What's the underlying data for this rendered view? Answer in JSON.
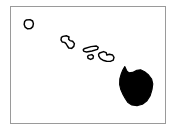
{
  "figure": {
    "subtitle": "Hawaiian Islands",
    "frame_visible": "true",
    "background_color": "#ffffff",
    "frame_color": "#9a9a9a",
    "outline_color": "#000000",
    "fill_color": "#000000",
    "caption": ""
  },
  "map": {
    "name": "hawaii-island-chain-map",
    "region_label": "Hawaii",
    "projection_note": "",
    "island_count": 6,
    "highlighted_island": "Hawaii (Big Island)",
    "islands": [
      {
        "id": "kauai",
        "label": "Kauai",
        "style": "outline",
        "fill": "#ffffff",
        "stroke": "#000000"
      },
      {
        "id": "oahu",
        "label": "Oahu",
        "style": "outline",
        "fill": "#ffffff",
        "stroke": "#000000"
      },
      {
        "id": "molokai",
        "label": "Molokai",
        "style": "outline",
        "fill": "#ffffff",
        "stroke": "#000000"
      },
      {
        "id": "lanai",
        "label": "Lanai",
        "style": "outline",
        "fill": "#ffffff",
        "stroke": "#000000"
      },
      {
        "id": "maui",
        "label": "Maui",
        "style": "outline",
        "fill": "#ffffff",
        "stroke": "#000000"
      },
      {
        "id": "hawaii",
        "label": "Hawaii",
        "style": "filled",
        "fill": "#000000",
        "stroke": "#000000"
      }
    ]
  }
}
